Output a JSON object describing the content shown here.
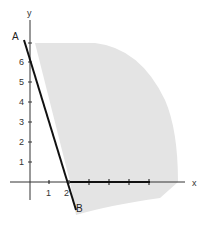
{
  "diagram": {
    "axes": {
      "x_label": "x",
      "y_label": "y"
    },
    "y_ticks": [
      "1",
      "2",
      "3",
      "4",
      "5",
      "6"
    ],
    "x_ticks": [
      "1",
      "2"
    ],
    "points": {
      "A": "A",
      "B": "B"
    },
    "colors": {
      "shade": "#e4e4e4",
      "axis": "#333333",
      "line": "#111111"
    }
  }
}
